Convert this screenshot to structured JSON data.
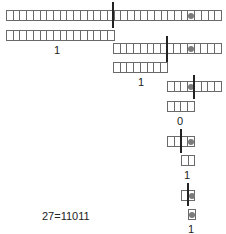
{
  "diagram": {
    "title_equation": "27=11011",
    "cell_size": 6.72,
    "colors": {
      "border": "#6a6a6a",
      "dot": "#7a7a7a",
      "split": "#222222"
    },
    "levels": [
      {
        "top": {
          "x": 6,
          "y": 10,
          "cells": 32,
          "dot_index": 27
        },
        "split_x": 113,
        "split_y": [
          2,
          28
        ],
        "bottom": {
          "x": 6,
          "y": 30,
          "cells": 16
        },
        "label": "1",
        "label_x": 57,
        "label_y": 45
      },
      {
        "top": {
          "x": 113,
          "y": 43,
          "cells": 16,
          "dot_index": 11
        },
        "split_x": 167,
        "split_y": [
          36,
          62
        ],
        "bottom": {
          "x": 113,
          "y": 62,
          "cells": 8
        },
        "label": "1",
        "label_x": 141,
        "label_y": 77
      },
      {
        "top": {
          "x": 167,
          "y": 81,
          "cells": 8,
          "dot_index": 3
        },
        "split_x": 194,
        "split_y": [
          75,
          99
        ],
        "bottom": {
          "x": 167,
          "y": 101,
          "cells": 4
        },
        "label": "0",
        "label_x": 180,
        "label_y": 116
      },
      {
        "top": {
          "x": 167,
          "y": 136,
          "cells": 4,
          "dot_index": 3
        },
        "split_x": 181,
        "split_y": [
          129,
          153
        ],
        "bottom": {
          "x": 181,
          "y": 155,
          "cells": 2
        },
        "label": "1",
        "label_x": 187,
        "label_y": 170
      },
      {
        "top": {
          "x": 181,
          "y": 190,
          "cells": 2,
          "dot_index": 1
        },
        "split_x": 188,
        "split_y": [
          183,
          206
        ],
        "bottom": {
          "x": 188,
          "y": 209,
          "cells": 1,
          "dot_index": 0
        },
        "label": "1",
        "label_x": 191,
        "label_y": 224
      }
    ],
    "equation": {
      "text": "27=11011",
      "x": 42,
      "y": 211
    },
    "binary_digits": [
      "1",
      "1",
      "0",
      "1",
      "1"
    ]
  }
}
